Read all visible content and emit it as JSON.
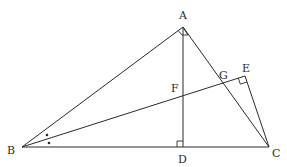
{
  "figure": {
    "type": "geometry",
    "labels": {
      "A": "A",
      "B": "B",
      "C": "C",
      "D": "D",
      "E": "E",
      "F": "F",
      "G": "G"
    },
    "points": {
      "A": [
        183,
        27
      ],
      "B": [
        22,
        147
      ],
      "C": [
        269,
        147
      ],
      "D": [
        183,
        147
      ],
      "E": [
        245,
        76
      ],
      "F": [
        183,
        97
      ],
      "G": [
        223,
        83
      ]
    },
    "segments": [
      "AB",
      "AC",
      "BC",
      "AD",
      "BE",
      "CE"
    ],
    "right_angles": [
      "A",
      "D",
      "E"
    ],
    "equal_angle_marks": [
      "ABE",
      "EBC"
    ]
  }
}
